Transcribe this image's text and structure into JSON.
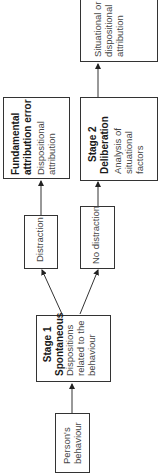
{
  "diagram": {
    "orientation": "rotated-90-ccw",
    "nodes": {
      "persons_behaviour": {
        "lines": [
          "Person's",
          "behaviour"
        ]
      },
      "stage1": {
        "title_lines": [
          "Stage 1",
          "Spontaneous"
        ],
        "body_lines": [
          "Dispositions",
          "related to the",
          "behaviour"
        ]
      },
      "distraction": {
        "label": "Distraction"
      },
      "no_distraction": {
        "label": "No distraction"
      },
      "fae": {
        "title_lines": [
          "Fundamental",
          "attribution error"
        ],
        "body_lines": [
          "Dispositional",
          "attribution"
        ]
      },
      "stage2": {
        "title_lines": [
          "Stage 2",
          "Deliberation"
        ],
        "body_lines": [
          "Analysis of",
          "situational",
          "factors"
        ]
      },
      "outcome": {
        "lines": [
          "Situational or",
          "dispositional",
          "attribution"
        ]
      }
    },
    "edges": [
      {
        "from": "persons_behaviour",
        "to": "stage1"
      },
      {
        "from": "stage1",
        "to": "distraction"
      },
      {
        "from": "stage1",
        "to": "no_distraction"
      },
      {
        "from": "distraction",
        "to": "fae"
      },
      {
        "from": "no_distraction",
        "to": "stage2"
      },
      {
        "from": "stage2",
        "to": "outcome"
      }
    ]
  }
}
